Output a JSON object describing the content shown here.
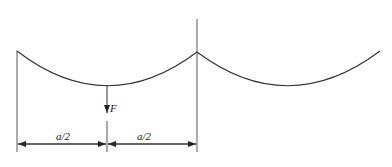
{
  "diagram": {
    "type": "cable-span-with-point-load",
    "labels": {
      "force": "F",
      "left_span": "a/2",
      "right_span": "a/2"
    },
    "colors": {
      "line": "#333333",
      "background": "#ffffff"
    }
  }
}
